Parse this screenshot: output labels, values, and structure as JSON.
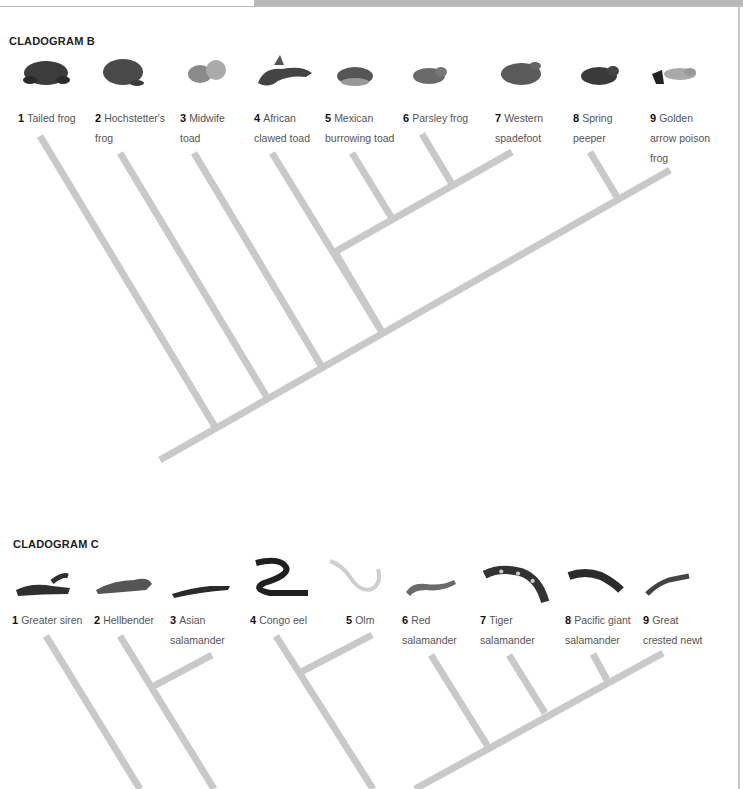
{
  "cladogram_b": {
    "title": "CLADOGRAM B",
    "leaves": [
      {
        "num": "1",
        "line1": "Tailed frog",
        "line2": "",
        "line3": "",
        "icon": "frog-icon",
        "color": "#3c3c3c"
      },
      {
        "num": "2",
        "line1": "Hochstetter's",
        "line2": "frog",
        "line3": "",
        "icon": "frog-icon",
        "color": "#4a4a4a"
      },
      {
        "num": "3",
        "line1": "Midwife",
        "line2": "toad",
        "line3": "",
        "icon": "toad-icon",
        "color": "#8a8a8a"
      },
      {
        "num": "4",
        "line1": "African",
        "line2": "clawed toad",
        "line3": "",
        "icon": "toad-icon",
        "color": "#444444"
      },
      {
        "num": "5",
        "line1": "Mexican",
        "line2": "burrowing toad",
        "line3": "",
        "icon": "toad-icon",
        "color": "#555555"
      },
      {
        "num": "6",
        "line1": "Parsley frog",
        "line2": "",
        "line3": "",
        "icon": "frog-icon",
        "color": "#6a6a6a"
      },
      {
        "num": "7",
        "line1": "Western",
        "line2": "spadefoot",
        "line3": "",
        "icon": "frog-icon",
        "color": "#5a5a5a"
      },
      {
        "num": "8",
        "line1": "Spring",
        "line2": "peeper",
        "line3": "",
        "icon": "frog-icon",
        "color": "#3a3a3a"
      },
      {
        "num": "9",
        "line1": "Golden",
        "line2": "arrow poison",
        "line3": "frog",
        "icon": "frog-icon",
        "color": "#9a9a9a"
      }
    ]
  },
  "cladogram_c": {
    "title": "CLADOGRAM C",
    "leaves": [
      {
        "num": "1",
        "line1": "Greater siren",
        "line2": "",
        "icon": "siren-icon",
        "color": "#2f2f2f"
      },
      {
        "num": "2",
        "line1": "Hellbender",
        "line2": "",
        "icon": "salamander-icon",
        "color": "#555555"
      },
      {
        "num": "3",
        "line1": "Asian",
        "line2": "salamander",
        "icon": "salamander-icon",
        "color": "#2a2a2a"
      },
      {
        "num": "4",
        "line1": "Congo eel",
        "line2": "",
        "icon": "eel-icon",
        "color": "#1f1f1f"
      },
      {
        "num": "5",
        "line1": "Olm",
        "line2": "",
        "icon": "olm-icon",
        "color": "#c8c8c8"
      },
      {
        "num": "6",
        "line1": "Red",
        "line2": "salamander",
        "icon": "salamander-icon",
        "color": "#6a6a6a"
      },
      {
        "num": "7",
        "line1": "Tiger",
        "line2": "salamander",
        "icon": "salamander-icon",
        "color": "#333333"
      },
      {
        "num": "8",
        "line1": "Pacific giant",
        "line2": "salamander",
        "icon": "salamander-icon",
        "color": "#2b2b2b"
      },
      {
        "num": "9",
        "line1": "Great",
        "line2": "crested newt",
        "icon": "newt-icon",
        "color": "#444444"
      }
    ]
  },
  "colors": {
    "branch": "#c9c9c9",
    "title": "#1e1e1e",
    "text": "#555555"
  }
}
